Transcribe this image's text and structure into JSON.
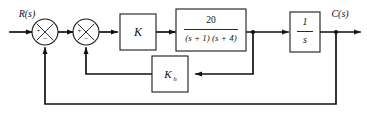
{
  "diagram": {
    "input_label": "R(s)",
    "output_label": "C(s)",
    "line_color": "#111111",
    "box_fill": "#ffffff",
    "box_stroke": "#1a1a1a",
    "background": "#ffffff"
  },
  "summing_junctions": [
    {
      "name": "outer-summing-junction",
      "plus_sign": "+",
      "minus_sign": "−",
      "plus_position": "left",
      "minus_position": "bottom"
    },
    {
      "name": "inner-summing-junction",
      "plus_sign": "+",
      "minus_sign": "−",
      "plus_position": "left",
      "minus_position": "bottom"
    }
  ],
  "blocks": [
    {
      "name": "gain-block",
      "label": "K"
    },
    {
      "name": "plant-transfer-function-block",
      "numerator": "20",
      "denominator": "(s + 1) (s + 4)"
    },
    {
      "name": "integrator-block",
      "numerator": "1",
      "denominator": "s"
    },
    {
      "name": "rate-feedback-block",
      "label": "K",
      "subscript": "h"
    }
  ],
  "signals": {
    "input": "R(s)",
    "output": "C(s)",
    "inner_feedback_source": "plant output",
    "inner_feedback_target": "inner summing junction",
    "outer_feedback_source": "C(s)",
    "outer_feedback_target": "outer summing junction"
  }
}
